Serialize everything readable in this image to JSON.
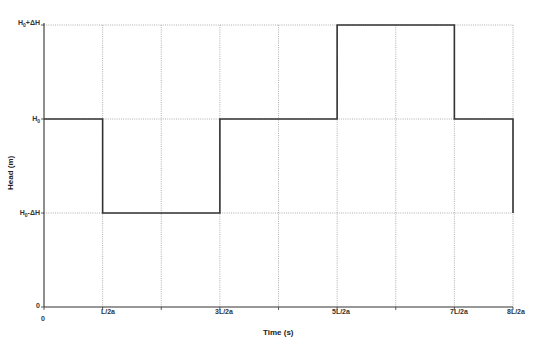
{
  "chart_data": {
    "type": "line",
    "title": "",
    "xlabel": "Time (s)",
    "ylabel": "Head (m)",
    "x_tick_labels": [
      "0",
      "L/2a",
      "3L/2a",
      "5L/2a",
      "7L/2a",
      "8L/2a"
    ],
    "x_tick_positions_in_L_over_2a": [
      0,
      1,
      3,
      5,
      7,
      8
    ],
    "y_tick_labels": [
      "0",
      "H0-ΔH",
      "H0",
      "H0+ΔH"
    ],
    "y_levels": {
      "0": 0,
      "H0-ΔH": 1,
      "H0": 2,
      "H0+ΔH": 3
    },
    "xlim": [
      0,
      8
    ],
    "ylim": [
      0,
      3
    ],
    "grid": true,
    "grid_style": "dotted",
    "vertical_gridlines_at": [
      1,
      2,
      3,
      4,
      5,
      6,
      7,
      8
    ],
    "horizontal_gridlines_at": [
      1,
      2,
      3
    ],
    "legend": null,
    "series": [
      {
        "name": "Head",
        "x": [
          0,
          1,
          1,
          3,
          3,
          5,
          5,
          7,
          7,
          8,
          8
        ],
        "y": [
          2,
          2,
          1,
          1,
          2,
          2,
          3,
          3,
          2,
          2,
          1
        ],
        "y_labels": [
          "H0",
          "H0",
          "H0-ΔH",
          "H0-ΔH",
          "H0",
          "H0",
          "H0+ΔH",
          "H0+ΔH",
          "H0",
          "H0",
          "H0-ΔH"
        ],
        "color": "#333333"
      }
    ]
  },
  "labels": {
    "y_top": "H",
    "y_top_sub": "0",
    "y_top_suffix": "+ΔH",
    "y_mid": "H",
    "y_mid_sub": "0",
    "y_low": "H",
    "y_low_sub": "0",
    "y_low_suffix": "-ΔH",
    "y_zero": "0",
    "x_zero": "0",
    "x_1": "L/2a",
    "x_3": "3L/2a",
    "x_5": "5L/2a",
    "x_7": "7L/2a",
    "x_8": "8L/2a",
    "x_title": "Time (s)",
    "y_title": "Head (m)"
  }
}
